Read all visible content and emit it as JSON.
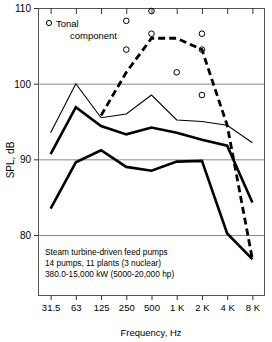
{
  "chart_data": {
    "type": "line",
    "title": "",
    "xlabel": "Frequency, Hz",
    "ylabel": "SPL, dB",
    "categories": [
      "31.5",
      "63",
      "125",
      "250",
      "500",
      "1 K",
      "2 K",
      "4 K",
      "8 K"
    ],
    "ylim": [
      76,
      110
    ],
    "yticks": [
      80,
      90,
      100,
      110
    ],
    "ytick_labels": [
      "80",
      "90",
      "100",
      "110"
    ],
    "grid": "horizontal",
    "legend": {
      "position": "top-left",
      "entries": [
        {
          "label_line1": "Tonal",
          "label_line2": "component",
          "marker": "open-circle"
        }
      ]
    },
    "annotation": {
      "line1": "Steam turbine-driven feed pumps",
      "line2": "14 pumps, 11 plants (3 nuclear)",
      "line3": "380.0-15,000 kW (5000-20,000 hp)"
    },
    "series": [
      {
        "name": "Upper bound (thin solid)",
        "style": "thin-solid",
        "values": [
          93.5,
          100.0,
          95.5,
          96.0,
          98.5,
          95.2,
          95.0,
          94.5,
          92.2
        ]
      },
      {
        "name": "Mean (thick solid)",
        "style": "thick-solid",
        "values": [
          90.7,
          96.9,
          94.4,
          93.3,
          94.2,
          93.5,
          92.6,
          91.8,
          84.3
        ]
      },
      {
        "name": "Lower bound (thick solid)",
        "style": "thick-solid",
        "values": [
          83.5,
          89.6,
          91.2,
          89.0,
          88.5,
          89.7,
          89.8,
          80.2,
          76.8
        ]
      },
      {
        "name": "Tonal envelope (dashed)",
        "style": "thick-dashed",
        "values": [
          null,
          null,
          95.8,
          101.5,
          106.0,
          106.0,
          104.5,
          94.5,
          76.8
        ]
      }
    ],
    "scatter": {
      "name": "Tonal component",
      "marker": "open-circle",
      "points": [
        {
          "x": "250",
          "y": 108.3
        },
        {
          "x": "250",
          "y": 104.5
        },
        {
          "x": "500",
          "y": 109.6
        },
        {
          "x": "500",
          "y": 106.6
        },
        {
          "x": "1 K",
          "y": 101.5
        },
        {
          "x": "2 K",
          "y": 106.6
        },
        {
          "x": "2 K",
          "y": 104.5
        },
        {
          "x": "2 K",
          "y": 98.5
        }
      ]
    }
  }
}
